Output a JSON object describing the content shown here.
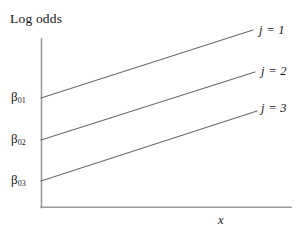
{
  "figure": {
    "title": "Log odds",
    "x_axis_label": "x",
    "intercept_labels": [
      {
        "symbol": "β",
        "subscript": "01"
      },
      {
        "symbol": "β",
        "subscript": "02"
      },
      {
        "symbol": "β",
        "subscript": "03"
      }
    ],
    "series_labels": [
      "j = 1",
      "j = 2",
      "j = 3"
    ],
    "line_color": "#6b6b6b",
    "axis_color": "#9a9a9a",
    "text_color": "#141414",
    "background_color": "#ffffff"
  },
  "chart_data": {
    "type": "line",
    "title": "Log odds",
    "xlabel": "x",
    "ylabel": "Log odds",
    "grid": false,
    "legend": "inline-right-end-of-line",
    "axis_ticks": {
      "x": [],
      "y": [
        "β01",
        "β02",
        "β03"
      ]
    },
    "xlim": [
      0,
      1
    ],
    "ylim": [
      0,
      1
    ],
    "note": "Three parallel ascending lines illustrating proportional odds: equal slopes, different intercepts β01 > β02 > β03.",
    "series": [
      {
        "name": "j = 1",
        "intercept_label": "β01",
        "points": [
          [
            0.0,
            0.645
          ],
          [
            1.0,
            1.045
          ]
        ],
        "pixel_points": [
          [
            41,
            98
          ],
          [
            253,
            30
          ]
        ]
      },
      {
        "name": "j = 2",
        "intercept_label": "β02",
        "points": [
          [
            0.0,
            0.395
          ],
          [
            1.0,
            0.795
          ]
        ],
        "pixel_points": [
          [
            41,
            140
          ],
          [
            255,
            72
          ]
        ]
      },
      {
        "name": "j = 3",
        "intercept_label": "β03",
        "points": [
          [
            0.0,
            0.155
          ],
          [
            1.0,
            0.555
          ]
        ],
        "pixel_points": [
          [
            41,
            181
          ],
          [
            257,
            111
          ]
        ]
      }
    ]
  }
}
